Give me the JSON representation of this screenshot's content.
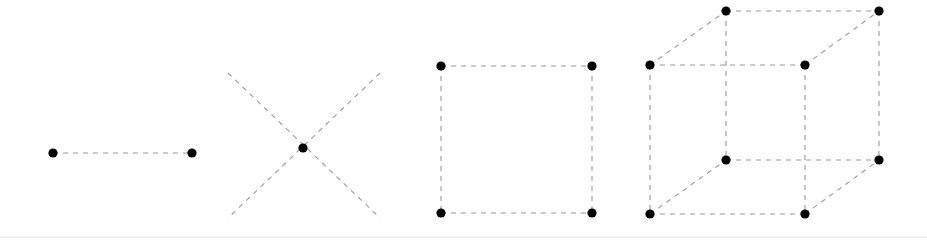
{
  "canvas": {
    "width": 927,
    "height": 245,
    "background": "#ffffff",
    "title": "Dimensional figures: point-line, diagonals, square, cube"
  },
  "style": {
    "edge_color": "#9a9a9a",
    "edge_width": 1.1,
    "edge_dash": "5 5",
    "vertex_color": "#000000",
    "vertex_radius": 4.6,
    "baseline_color": "#e2e2e2"
  },
  "baseline": {
    "x1": 0,
    "y1": 237,
    "x2": 927,
    "y2": 237
  },
  "figures": [
    {
      "id": "figure-line",
      "name": "one-dimensional-line",
      "label": "1D line segment",
      "dimension": 1,
      "vertex_count": 2,
      "edge_count": 1,
      "vertices": [
        {
          "name": "left-endpoint",
          "x": 53,
          "y": 153
        },
        {
          "name": "right-endpoint",
          "x": 192,
          "y": 153
        }
      ],
      "edges": [
        {
          "name": "segment",
          "x1": 53,
          "y1": 153,
          "x2": 192,
          "y2": 153
        }
      ]
    },
    {
      "id": "figure-diagonals",
      "name": "crossed-diagonals",
      "label": "Diagonal cross with center point",
      "dimension": 2,
      "vertex_count": 1,
      "edge_count": 2,
      "vertices": [
        {
          "name": "center-point",
          "x": 303,
          "y": 148
        }
      ],
      "edges": [
        {
          "name": "diagonal-nw-se",
          "x1": 228,
          "y1": 73,
          "x2": 380,
          "y2": 218
        },
        {
          "name": "diagonal-ne-sw",
          "x1": 380,
          "y1": 73,
          "x2": 228,
          "y2": 218
        }
      ]
    },
    {
      "id": "figure-square",
      "name": "two-dimensional-square",
      "label": "2D square",
      "dimension": 2,
      "vertex_count": 4,
      "edge_count": 4,
      "vertices": [
        {
          "name": "top-left-corner",
          "x": 441,
          "y": 66
        },
        {
          "name": "top-right-corner",
          "x": 592,
          "y": 66
        },
        {
          "name": "bottom-left-corner",
          "x": 441,
          "y": 213
        },
        {
          "name": "bottom-right-corner",
          "x": 592,
          "y": 213
        }
      ],
      "edges": [
        {
          "name": "top-edge",
          "x1": 441,
          "y1": 66,
          "x2": 592,
          "y2": 66
        },
        {
          "name": "right-edge",
          "x1": 592,
          "y1": 66,
          "x2": 592,
          "y2": 213
        },
        {
          "name": "bottom-edge",
          "x1": 441,
          "y1": 213,
          "x2": 592,
          "y2": 213
        },
        {
          "name": "left-edge",
          "x1": 441,
          "y1": 66,
          "x2": 441,
          "y2": 213
        }
      ]
    },
    {
      "id": "figure-cube",
      "name": "three-dimensional-cube",
      "label": "3D cube wireframe",
      "dimension": 3,
      "vertex_count": 8,
      "edge_count": 12,
      "vertices": [
        {
          "name": "front-top-left",
          "x": 650,
          "y": 65
        },
        {
          "name": "front-top-right",
          "x": 805,
          "y": 65
        },
        {
          "name": "front-bottom-left",
          "x": 650,
          "y": 214
        },
        {
          "name": "front-bottom-right",
          "x": 805,
          "y": 214
        },
        {
          "name": "back-top-left",
          "x": 726,
          "y": 11
        },
        {
          "name": "back-top-right",
          "x": 879,
          "y": 11
        },
        {
          "name": "back-bottom-left",
          "x": 726,
          "y": 160
        },
        {
          "name": "back-bottom-right",
          "x": 879,
          "y": 160
        }
      ],
      "edges": [
        {
          "name": "front-top-edge",
          "x1": 650,
          "y1": 65,
          "x2": 805,
          "y2": 65
        },
        {
          "name": "front-right-edge",
          "x1": 805,
          "y1": 65,
          "x2": 805,
          "y2": 214
        },
        {
          "name": "front-bottom-edge",
          "x1": 650,
          "y1": 214,
          "x2": 805,
          "y2": 214
        },
        {
          "name": "front-left-edge",
          "x1": 650,
          "y1": 65,
          "x2": 650,
          "y2": 214
        },
        {
          "name": "back-top-edge",
          "x1": 726,
          "y1": 11,
          "x2": 879,
          "y2": 11
        },
        {
          "name": "back-right-edge",
          "x1": 879,
          "y1": 11,
          "x2": 879,
          "y2": 160
        },
        {
          "name": "back-bottom-edge",
          "x1": 726,
          "y1": 160,
          "x2": 879,
          "y2": 160
        },
        {
          "name": "back-left-edge",
          "x1": 726,
          "y1": 11,
          "x2": 726,
          "y2": 160
        },
        {
          "name": "connector-top-left",
          "x1": 650,
          "y1": 65,
          "x2": 726,
          "y2": 11
        },
        {
          "name": "connector-top-right",
          "x1": 805,
          "y1": 65,
          "x2": 879,
          "y2": 11
        },
        {
          "name": "connector-bottom-left",
          "x1": 650,
          "y1": 214,
          "x2": 726,
          "y2": 160
        },
        {
          "name": "connector-bottom-right",
          "x1": 805,
          "y1": 214,
          "x2": 879,
          "y2": 160
        }
      ]
    }
  ]
}
